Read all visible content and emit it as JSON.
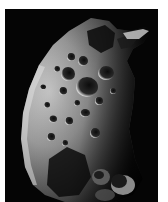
{
  "image": {
    "subject": "cratered irregular moon",
    "alt": "Heavily cratered irregular moon lit from the left against a black sky",
    "background_color": "#050505",
    "border_color": "#ffffff"
  }
}
